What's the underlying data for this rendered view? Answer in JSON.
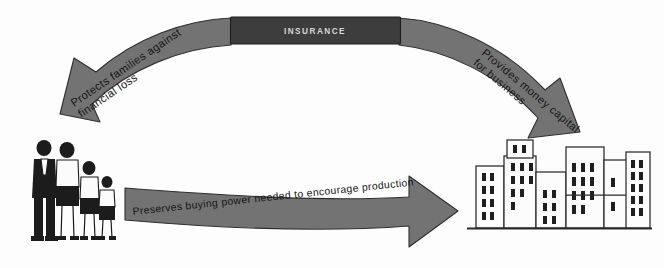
{
  "diagram": {
    "center_node": {
      "label": "INSURANCE",
      "box_color": "#3d3d3d",
      "text_color": "#d8d8d8"
    },
    "arrow_color": "#737373",
    "arrow_outline_color": "#2f2f2f",
    "background_color": "#fdfdfd",
    "arrows": [
      {
        "id": "insurance-to-family",
        "label_lines": [
          "Protects families against",
          "financial loss"
        ],
        "from": "INSURANCE",
        "to": "family",
        "direction": "down-left"
      },
      {
        "id": "insurance-to-business",
        "label_lines": [
          "Provides money capital",
          "for business"
        ],
        "from": "INSURANCE",
        "to": "business",
        "direction": "down-right"
      },
      {
        "id": "family-to-business",
        "label_lines": [
          "Preserves buying power needed to encourage production"
        ],
        "from": "family",
        "to": "business",
        "direction": "right"
      }
    ],
    "nodes": [
      {
        "id": "family",
        "name": "family-illustration",
        "figures": 4
      },
      {
        "id": "business",
        "name": "city-buildings-illustration",
        "buildings": 6
      }
    ]
  }
}
